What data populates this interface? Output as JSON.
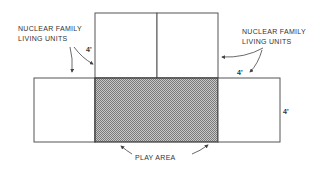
{
  "diagram": {
    "labels": {
      "left_units_line1": "NUCLEAR FAMILY",
      "left_units_line2": "LIVING UNITS",
      "right_units_line1": "NUCLEAR FAMILY",
      "right_units_line2": "LIVING UNITS",
      "play_area": "PLAY AREA"
    },
    "dimensions": {
      "top_left": "4'",
      "top_right": "4'",
      "right_side": "4'"
    },
    "colors": {
      "line": "#555555",
      "hatch": "#9a9a9a",
      "text": "#333333"
    }
  }
}
